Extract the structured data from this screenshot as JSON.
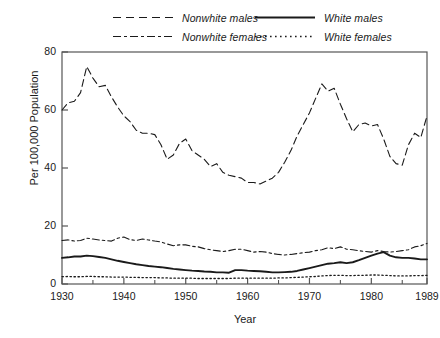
{
  "chart_data": {
    "type": "line",
    "title": "",
    "xlabel": "Year",
    "ylabel": "Per 100,000 Population",
    "xlim": [
      1930,
      1989
    ],
    "ylim": [
      0,
      80
    ],
    "xticks": [
      1930,
      1940,
      1950,
      1960,
      1970,
      1980,
      1989
    ],
    "xticklabels": [
      "1930",
      "1940",
      "1950",
      "1960",
      "1970",
      "1980",
      "1989"
    ],
    "xminorticks": [
      1935,
      1945,
      1955,
      1965,
      1975,
      1985
    ],
    "yticks": [
      0,
      20,
      40,
      60,
      80
    ],
    "yticklabels": [
      "0",
      "20",
      "40",
      "60",
      "80"
    ],
    "grid": false,
    "legend_position": "above-plot",
    "x": [
      1930,
      1931,
      1932,
      1933,
      1934,
      1935,
      1936,
      1937,
      1938,
      1939,
      1940,
      1941,
      1942,
      1943,
      1944,
      1945,
      1946,
      1947,
      1948,
      1949,
      1950,
      1951,
      1952,
      1953,
      1954,
      1955,
      1956,
      1957,
      1958,
      1959,
      1960,
      1961,
      1962,
      1963,
      1964,
      1965,
      1966,
      1967,
      1968,
      1969,
      1970,
      1971,
      1972,
      1973,
      1974,
      1975,
      1976,
      1977,
      1978,
      1979,
      1980,
      1981,
      1982,
      1983,
      1984,
      1985,
      1986,
      1987,
      1988,
      1989
    ],
    "series": [
      {
        "name": "Nonwhite males",
        "style": "dashed",
        "color": "#1a1a1a",
        "values": [
          60.0,
          62.5,
          63.0,
          66.0,
          75.0,
          71.0,
          68.0,
          68.5,
          64.5,
          61.0,
          58.0,
          56.0,
          53.0,
          52.0,
          52.0,
          51.5,
          48.0,
          43.0,
          44.5,
          48.5,
          50.0,
          46.0,
          44.5,
          43.0,
          40.5,
          41.5,
          38.5,
          37.5,
          37.0,
          36.5,
          35.0,
          35.0,
          34.5,
          35.5,
          36.5,
          38.5,
          42.0,
          46.0,
          51.0,
          55.0,
          59.0,
          64.0,
          69.0,
          66.5,
          67.5,
          62.0,
          57.0,
          52.5,
          55.0,
          55.5,
          54.5,
          55.0,
          50.0,
          44.0,
          41.5,
          41.0,
          48.0,
          52.0,
          50.5,
          58.0
        ]
      },
      {
        "name": "Nonwhite females",
        "style": "dashdotdot",
        "color": "#1a1a1a",
        "values": [
          15.0,
          15.2,
          14.8,
          15.0,
          15.8,
          15.5,
          15.2,
          15.0,
          14.8,
          15.8,
          16.2,
          15.3,
          15.0,
          15.5,
          15.2,
          14.8,
          14.5,
          13.8,
          13.2,
          13.5,
          13.5,
          13.0,
          12.8,
          12.2,
          11.8,
          11.5,
          11.2,
          11.5,
          12.0,
          12.0,
          11.5,
          11.0,
          11.2,
          11.0,
          10.5,
          10.2,
          10.0,
          10.2,
          10.5,
          10.8,
          11.0,
          11.5,
          11.8,
          12.5,
          12.2,
          12.8,
          12.0,
          11.8,
          11.5,
          11.2,
          11.0,
          11.5,
          11.2,
          11.0,
          11.2,
          11.5,
          11.8,
          12.8,
          13.2,
          14.0
        ]
      },
      {
        "name": "White males",
        "style": "solid",
        "color": "#1a1a1a",
        "values": [
          9.0,
          9.2,
          9.5,
          9.5,
          9.8,
          9.6,
          9.3,
          9.0,
          8.5,
          8.0,
          7.6,
          7.2,
          6.8,
          6.5,
          6.2,
          6.0,
          5.8,
          5.5,
          5.2,
          5.0,
          4.8,
          4.6,
          4.5,
          4.3,
          4.2,
          4.0,
          4.0,
          3.9,
          4.8,
          4.8,
          4.6,
          4.5,
          4.4,
          4.2,
          4.0,
          4.0,
          4.1,
          4.2,
          4.5,
          5.0,
          5.5,
          6.0,
          6.5,
          7.0,
          7.2,
          7.5,
          7.2,
          7.5,
          8.2,
          9.0,
          9.8,
          10.5,
          11.0,
          9.8,
          9.2,
          9.0,
          9.0,
          8.8,
          8.5,
          8.5
        ]
      },
      {
        "name": "White females",
        "style": "dotted",
        "color": "#1a1a1a",
        "values": [
          2.5,
          2.6,
          2.5,
          2.5,
          2.6,
          2.6,
          2.5,
          2.5,
          2.4,
          2.4,
          2.4,
          2.3,
          2.3,
          2.2,
          2.2,
          2.2,
          2.1,
          2.1,
          2.0,
          2.0,
          2.0,
          2.0,
          1.9,
          1.9,
          1.9,
          1.9,
          1.9,
          1.9,
          2.0,
          2.0,
          2.0,
          2.0,
          2.0,
          2.0,
          2.0,
          2.1,
          2.1,
          2.2,
          2.3,
          2.4,
          2.5,
          2.6,
          2.8,
          2.9,
          3.0,
          3.0,
          2.9,
          2.9,
          3.0,
          3.0,
          3.1,
          3.1,
          3.0,
          2.9,
          2.8,
          2.8,
          2.8,
          2.9,
          2.9,
          3.0
        ]
      }
    ]
  },
  "legend": {
    "entries": [
      {
        "label": "Nonwhite males",
        "style": "dashed"
      },
      {
        "label": "Nonwhite females",
        "style": "dashdotdot"
      },
      {
        "label": "White males",
        "style": "solid"
      },
      {
        "label": "White females",
        "style": "dotted"
      }
    ]
  },
  "axes": {
    "ylabel": "Per 100,000 Population",
    "xlabel": "Year"
  }
}
